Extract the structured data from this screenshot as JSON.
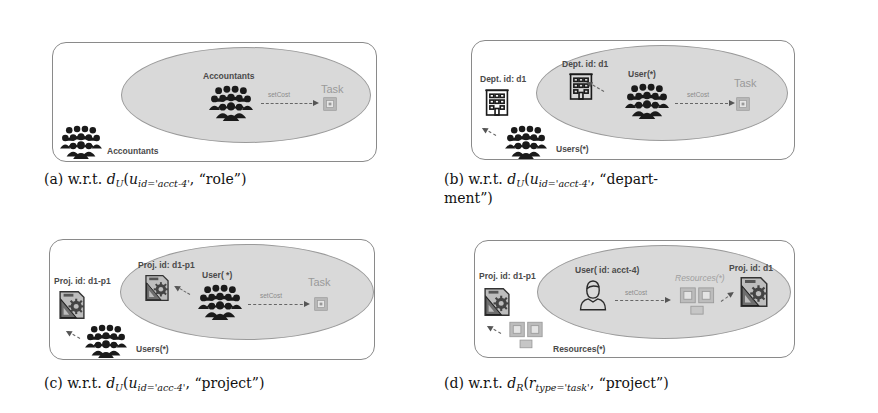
{
  "figure": {
    "panels": [
      {
        "id": "a",
        "outer_group_label": "Accountants",
        "inner_group_label": "Accountants",
        "edge_label": "setCost",
        "target_label": "Task",
        "caption": {
          "prefix": "(a) w.r.t. ",
          "func": "d",
          "func_sub": "U",
          "arg": "u",
          "arg_sub": "id='acct-4'",
          "suffix": ", “role”)"
        }
      },
      {
        "id": "b",
        "outer_entity_label": "Dept. id: d1",
        "outer_group_label": "Users(*)",
        "inner_entity_label": "Dept. id: d1",
        "inner_group_label": "User(*)",
        "edge_label": "setCost",
        "target_label": "Task",
        "caption": {
          "prefix": "(b)  w.r.t.  ",
          "func": "d",
          "func_sub": "U",
          "arg": "u",
          "arg_sub": "id='acct-4'",
          "suffix": ",   “depart-",
          "line2": "ment”)"
        }
      },
      {
        "id": "c",
        "outer_entity_label": "Proj. id: d1-p1",
        "outer_group_label": "Users(*)",
        "inner_entity_label": "Proj. id: d1-p1",
        "inner_group_label": "User( *)",
        "edge_label": "setCost",
        "target_label": "Task",
        "caption": {
          "prefix": "(c) w.r.t. ",
          "func": "d",
          "func_sub": "U",
          "arg": "u",
          "arg_sub": "id='acc-4'",
          "suffix": ", “project”)"
        }
      },
      {
        "id": "d",
        "outer_entity_label": "Proj. id: d1-p1",
        "outer_group_label": "Resources(*)",
        "inner_user_label": "User( id: acct-4)",
        "inner_resources_label": "Resources(*)",
        "inner_entity_label": "Proj. id: d1",
        "edge_label": "setCost",
        "caption": {
          "prefix": "(d) w.r.t. ",
          "func": "d",
          "func_sub": "R",
          "arg": "r",
          "arg_sub": "type='task'",
          "suffix": ", “project”)"
        }
      }
    ],
    "icons": {
      "group": "people-group-icon",
      "building": "building-icon",
      "project": "project-blueprint-icon",
      "task": "task-box-icon",
      "user": "user-icon"
    },
    "colors": {
      "ellipse_fill": "#d9d9d9",
      "panel_border": "#8a8a8a",
      "icon_dark": "#1a1a1a",
      "task_gray": "#a8a8a8"
    }
  }
}
